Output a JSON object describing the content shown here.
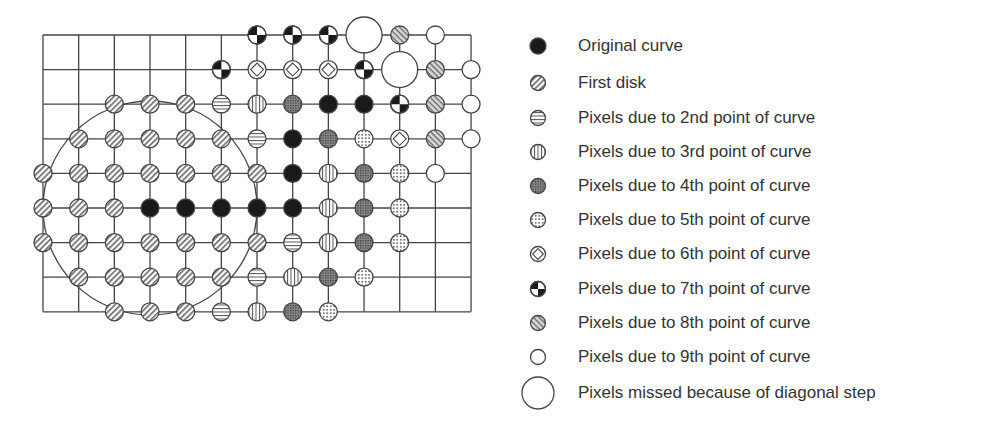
{
  "diagram": {
    "title": "",
    "grid": {
      "cols": 13,
      "rows": 9,
      "x0": 43,
      "y0": 35,
      "dx": 35.67,
      "dy": 34.6
    },
    "disk_outline": {
      "col": 3,
      "row": 5,
      "radius_px": 107
    },
    "pixels": [
      {
        "r": 0,
        "c": 6,
        "t": "7"
      },
      {
        "r": 0,
        "c": 7,
        "t": "7"
      },
      {
        "r": 0,
        "c": 8,
        "t": "7"
      },
      {
        "r": 0,
        "c": 9,
        "t": "M"
      },
      {
        "r": 0,
        "c": 10,
        "t": "8"
      },
      {
        "r": 0,
        "c": 11,
        "t": "9"
      },
      {
        "r": 1,
        "c": 5,
        "t": "7"
      },
      {
        "r": 1,
        "c": 6,
        "t": "6"
      },
      {
        "r": 1,
        "c": 7,
        "t": "6"
      },
      {
        "r": 1,
        "c": 8,
        "t": "6"
      },
      {
        "r": 1,
        "c": 9,
        "t": "7"
      },
      {
        "r": 1,
        "c": 10,
        "t": "M"
      },
      {
        "r": 1,
        "c": 11,
        "t": "8"
      },
      {
        "r": 1,
        "c": 12,
        "t": "9"
      },
      {
        "r": 2,
        "c": 2,
        "t": "F"
      },
      {
        "r": 2,
        "c": 3,
        "t": "F"
      },
      {
        "r": 2,
        "c": 4,
        "t": "F"
      },
      {
        "r": 2,
        "c": 5,
        "t": "2"
      },
      {
        "r": 2,
        "c": 6,
        "t": "3"
      },
      {
        "r": 2,
        "c": 7,
        "t": "4"
      },
      {
        "r": 2,
        "c": 8,
        "t": "O"
      },
      {
        "r": 2,
        "c": 9,
        "t": "O"
      },
      {
        "r": 2,
        "c": 10,
        "t": "7"
      },
      {
        "r": 2,
        "c": 11,
        "t": "8"
      },
      {
        "r": 2,
        "c": 12,
        "t": "9"
      },
      {
        "r": 3,
        "c": 1,
        "t": "F"
      },
      {
        "r": 3,
        "c": 2,
        "t": "F"
      },
      {
        "r": 3,
        "c": 3,
        "t": "F"
      },
      {
        "r": 3,
        "c": 4,
        "t": "F"
      },
      {
        "r": 3,
        "c": 5,
        "t": "F"
      },
      {
        "r": 3,
        "c": 6,
        "t": "2"
      },
      {
        "r": 3,
        "c": 7,
        "t": "O"
      },
      {
        "r": 3,
        "c": 8,
        "t": "4"
      },
      {
        "r": 3,
        "c": 9,
        "t": "5"
      },
      {
        "r": 3,
        "c": 10,
        "t": "6"
      },
      {
        "r": 3,
        "c": 11,
        "t": "8"
      },
      {
        "r": 3,
        "c": 12,
        "t": "9"
      },
      {
        "r": 4,
        "c": 0,
        "t": "F"
      },
      {
        "r": 4,
        "c": 1,
        "t": "F"
      },
      {
        "r": 4,
        "c": 2,
        "t": "F"
      },
      {
        "r": 4,
        "c": 3,
        "t": "F"
      },
      {
        "r": 4,
        "c": 4,
        "t": "F"
      },
      {
        "r": 4,
        "c": 5,
        "t": "F"
      },
      {
        "r": 4,
        "c": 6,
        "t": "F"
      },
      {
        "r": 4,
        "c": 7,
        "t": "O"
      },
      {
        "r": 4,
        "c": 8,
        "t": "3"
      },
      {
        "r": 4,
        "c": 9,
        "t": "4"
      },
      {
        "r": 4,
        "c": 10,
        "t": "5"
      },
      {
        "r": 4,
        "c": 11,
        "t": "9"
      },
      {
        "r": 5,
        "c": 0,
        "t": "F"
      },
      {
        "r": 5,
        "c": 1,
        "t": "F"
      },
      {
        "r": 5,
        "c": 2,
        "t": "F"
      },
      {
        "r": 5,
        "c": 3,
        "t": "O"
      },
      {
        "r": 5,
        "c": 4,
        "t": "O"
      },
      {
        "r": 5,
        "c": 5,
        "t": "O"
      },
      {
        "r": 5,
        "c": 6,
        "t": "O"
      },
      {
        "r": 5,
        "c": 7,
        "t": "O"
      },
      {
        "r": 5,
        "c": 8,
        "t": "3"
      },
      {
        "r": 5,
        "c": 9,
        "t": "4"
      },
      {
        "r": 5,
        "c": 10,
        "t": "5"
      },
      {
        "r": 6,
        "c": 0,
        "t": "F"
      },
      {
        "r": 6,
        "c": 1,
        "t": "F"
      },
      {
        "r": 6,
        "c": 2,
        "t": "F"
      },
      {
        "r": 6,
        "c": 3,
        "t": "F"
      },
      {
        "r": 6,
        "c": 4,
        "t": "F"
      },
      {
        "r": 6,
        "c": 5,
        "t": "F"
      },
      {
        "r": 6,
        "c": 6,
        "t": "F"
      },
      {
        "r": 6,
        "c": 7,
        "t": "2"
      },
      {
        "r": 6,
        "c": 8,
        "t": "3"
      },
      {
        "r": 6,
        "c": 9,
        "t": "4"
      },
      {
        "r": 6,
        "c": 10,
        "t": "5"
      },
      {
        "r": 7,
        "c": 1,
        "t": "F"
      },
      {
        "r": 7,
        "c": 2,
        "t": "F"
      },
      {
        "r": 7,
        "c": 3,
        "t": "F"
      },
      {
        "r": 7,
        "c": 4,
        "t": "F"
      },
      {
        "r": 7,
        "c": 5,
        "t": "F"
      },
      {
        "r": 7,
        "c": 6,
        "t": "2"
      },
      {
        "r": 7,
        "c": 7,
        "t": "3"
      },
      {
        "r": 7,
        "c": 8,
        "t": "4"
      },
      {
        "r": 7,
        "c": 9,
        "t": "5"
      },
      {
        "r": 8,
        "c": 2,
        "t": "F"
      },
      {
        "r": 8,
        "c": 3,
        "t": "F"
      },
      {
        "r": 8,
        "c": 4,
        "t": "F"
      },
      {
        "r": 8,
        "c": 5,
        "t": "2"
      },
      {
        "r": 8,
        "c": 6,
        "t": "3"
      },
      {
        "r": 8,
        "c": 7,
        "t": "4"
      },
      {
        "r": 8,
        "c": 8,
        "t": "5"
      }
    ]
  },
  "legend": {
    "items": [
      {
        "key": "O",
        "icon": "solid-black-circle-icon",
        "label": "Original curve",
        "y": 46
      },
      {
        "key": "F",
        "icon": "backslash-hatched-circle-icon",
        "label": "First disk",
        "y": 83
      },
      {
        "key": "2",
        "icon": "horizontal-striped-circle-icon",
        "label": "Pixels due to 2nd point of curve",
        "y": 118
      },
      {
        "key": "3",
        "icon": "vertical-striped-circle-icon",
        "label": "Pixels due to 3rd point of curve",
        "y": 152
      },
      {
        "key": "4",
        "icon": "dense-dotted-circle-icon",
        "label": "Pixels due to 4th point of curve",
        "y": 186
      },
      {
        "key": "5",
        "icon": "sparse-dotted-circle-icon",
        "label": "Pixels due to 5th point of curve",
        "y": 220
      },
      {
        "key": "6",
        "icon": "diamond-circle-icon",
        "label": "Pixels due to 6th point of curve",
        "y": 254
      },
      {
        "key": "7",
        "icon": "quartered-circle-icon",
        "label": "Pixels due to 7th point of curve",
        "y": 289
      },
      {
        "key": "8",
        "icon": "slash-hatched-circle-icon",
        "label": "Pixels due to 8th point of curve",
        "y": 323
      },
      {
        "key": "9",
        "icon": "empty-circle-icon",
        "label": "Pixels due to 9th point of curve",
        "y": 357
      },
      {
        "key": "M",
        "icon": "large-empty-circle-icon",
        "label": "Pixels missed because of diagonal step",
        "y": 393
      }
    ]
  },
  "colors": {
    "line": "#444444",
    "text": "#333333",
    "fill_dark": "#1a1a1a",
    "fill_gray": "#777777"
  }
}
